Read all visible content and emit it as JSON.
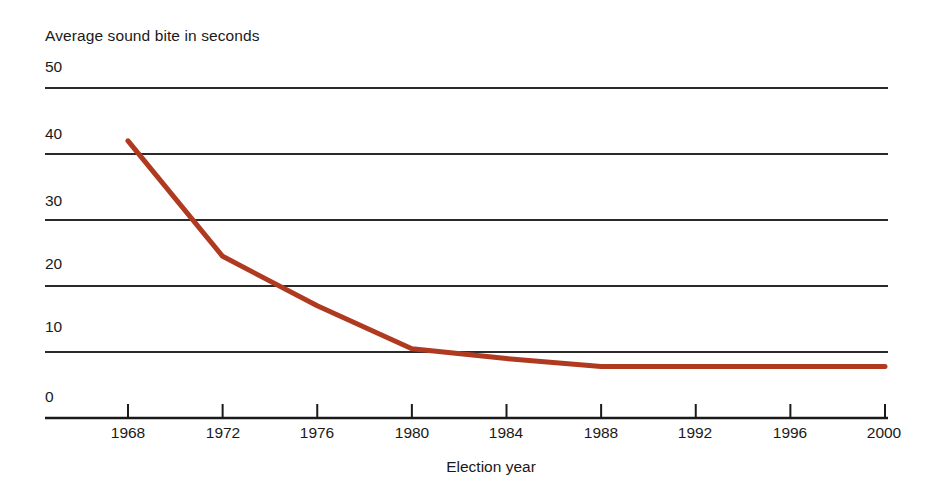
{
  "chart_data": {
    "type": "line",
    "title": "",
    "ylabel": "Average sound bite in seconds",
    "xlabel": "Election year",
    "categories": [
      1968,
      1972,
      1976,
      1980,
      1984,
      1988,
      1992,
      1996,
      2000
    ],
    "x_tick_labels": [
      "1968",
      "1972",
      "1976",
      "1980",
      "1984",
      "1988",
      "1992",
      "1996",
      "2000"
    ],
    "y_tick_labels": [
      "0",
      "10",
      "20",
      "30",
      "40",
      "50"
    ],
    "y_ticks": [
      0,
      10,
      20,
      30,
      40,
      50
    ],
    "ylim": [
      0,
      50
    ],
    "xlim": [
      1968,
      2000
    ],
    "grid": "horizontal",
    "legend": "none",
    "series": [
      {
        "name": "Average sound bite",
        "color": "#b03a20",
        "values": [
          42.0,
          24.5,
          17.0,
          10.5,
          9.0,
          7.8,
          7.8,
          7.8,
          7.8
        ]
      }
    ]
  },
  "axis": {
    "y_title": "Average sound bite in seconds",
    "x_title": "Election year",
    "y_labels": [
      "50",
      "40",
      "30",
      "20",
      "10",
      "0"
    ],
    "x_labels": [
      "1968",
      "1972",
      "1976",
      "1980",
      "1984",
      "1988",
      "1992",
      "1996",
      "2000"
    ]
  },
  "colors": {
    "line": "#b03a20",
    "grid": "#2a2a2a",
    "axis": "#1a1a1a",
    "background": "#ffffff",
    "text": "#1a1a1a"
  }
}
